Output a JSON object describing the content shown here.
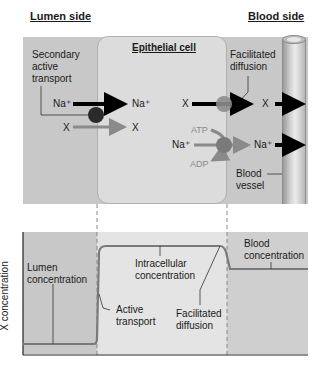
{
  "headers": {
    "lumen_side": "Lumen side",
    "blood_side": "Blood side",
    "epithelial_cell": "Epithelial cell"
  },
  "top_panel": {
    "secondary_active_transport": [
      "Secondary",
      "active",
      "transport"
    ],
    "facilitated_diffusion": [
      "Facilitated",
      "diffusion"
    ],
    "na_left": "Na⁺",
    "na_right": "Na⁺",
    "x_left": "X",
    "x_right": "X",
    "x_cell": "X",
    "x_blood": "X",
    "atp": "ATP",
    "adp": "ADP",
    "na_pump_in": "Na⁺",
    "na_pump_out": "Na⁺",
    "blood_vessel": [
      "Blood",
      "vessel"
    ]
  },
  "bottom_panel": {
    "y_axis_label": "X concentration",
    "lumen_concentration": [
      "Lumen",
      "concentration"
    ],
    "active_transport": [
      "Active",
      "transport"
    ],
    "intracellular_concentration": [
      "Intracellular",
      "concentration"
    ],
    "facilitated_diffusion": [
      "Facilitated",
      "diffusion"
    ],
    "blood_concentration": [
      "Blood",
      "concentration"
    ]
  },
  "colors": {
    "panel_gray": "#c8c8c8",
    "cell_gray": "#dcdcdc",
    "transporter_dark": "#2a2a2a",
    "carrier_gray": "#8c8c8c",
    "curve": "#7a7a7a",
    "arrow_black": "#000000",
    "arrow_gray": "#8a8a8a"
  }
}
